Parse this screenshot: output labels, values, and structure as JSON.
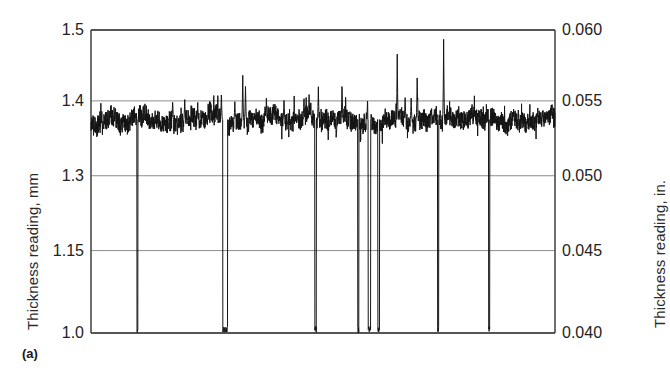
{
  "figure": {
    "caption": "(a)",
    "background_color": "#ffffff",
    "trace_color": "#141414",
    "grid_color": "#808080",
    "frame_color": "#4a4a4a"
  },
  "axes": {
    "left_title": "Thickness reading, mm",
    "right_title": "Thickness reading, in.",
    "left_ticks": [
      "1.5",
      "1.4",
      "1.3",
      "1.15",
      "1.0"
    ],
    "right_ticks": [
      "0.060",
      "0.055",
      "0.050",
      "0.045",
      "0.040"
    ]
  },
  "chart_data": {
    "type": "line",
    "title": "",
    "subtitle": "",
    "xlabel": "",
    "ylabel": "Thickness reading, mm",
    "ylabel_secondary": "Thickness reading, in.",
    "grid": true,
    "legend": "none",
    "annotations": [
      "(a)"
    ],
    "ylim": [
      1.0,
      1.5
    ],
    "ylim_secondary": [
      0.04,
      0.06
    ],
    "ytick_labels": [
      "1.5",
      "1.4",
      "1.3",
      "1.15",
      "1.0"
    ],
    "ytick_values": [
      1.5,
      1.4,
      1.3,
      1.15,
      1.0
    ],
    "ytick_positions_fraction": [
      0.0,
      0.234,
      0.481,
      0.728,
      1.0
    ],
    "ytick_labels_secondary": [
      "0.060",
      "0.055",
      "0.050",
      "0.045",
      "0.040"
    ],
    "ytick_values_secondary": [
      0.06,
      0.055,
      0.05,
      0.045,
      0.04
    ],
    "xlim": [
      0,
      1000
    ],
    "xtick_labels": [],
    "series": [
      {
        "name": "Thickness reading",
        "description": "Continuous thickness trace: noisy baseline near 1.375 mm with narrow upward spikes and several full-depth dropouts to 1.0 mm",
        "baseline_mm": 1.375,
        "noise_amplitude_mm": 0.022,
        "up_spikes": [
          {
            "x": 100,
            "peak_mm": 1.492
          },
          {
            "x": 176,
            "peak_mm": 1.402
          },
          {
            "x": 202,
            "peak_mm": 1.404
          },
          {
            "x": 230,
            "peak_mm": 1.398
          },
          {
            "x": 281,
            "peak_mm": 1.414
          },
          {
            "x": 310,
            "peak_mm": 1.399
          },
          {
            "x": 327,
            "peak_mm": 1.441
          },
          {
            "x": 333,
            "peak_mm": 1.424
          },
          {
            "x": 378,
            "peak_mm": 1.406
          },
          {
            "x": 416,
            "peak_mm": 1.405
          },
          {
            "x": 459,
            "peak_mm": 1.408
          },
          {
            "x": 470,
            "peak_mm": 1.409
          },
          {
            "x": 484,
            "peak_mm": 1.407
          },
          {
            "x": 490,
            "peak_mm": 1.42
          },
          {
            "x": 541,
            "peak_mm": 1.428
          },
          {
            "x": 596,
            "peak_mm": 1.404
          },
          {
            "x": 660,
            "peak_mm": 1.466
          },
          {
            "x": 677,
            "peak_mm": 1.407
          },
          {
            "x": 690,
            "peak_mm": 1.404
          },
          {
            "x": 703,
            "peak_mm": 1.437
          },
          {
            "x": 760,
            "peak_mm": 1.487
          }
        ],
        "down_spikes": [
          {
            "x": 100,
            "min_mm": 1.0,
            "width": 4
          },
          {
            "x": 289,
            "min_mm": 1.0,
            "width": 12
          },
          {
            "x": 484,
            "min_mm": 1.0,
            "width": 5
          },
          {
            "x": 576,
            "min_mm": 1.0,
            "width": 4
          },
          {
            "x": 600,
            "min_mm": 1.0,
            "width": 7
          },
          {
            "x": 620,
            "min_mm": 1.0,
            "width": 5
          },
          {
            "x": 748,
            "min_mm": 1.0,
            "width": 4
          },
          {
            "x": 858,
            "min_mm": 1.0,
            "width": 4
          }
        ]
      }
    ]
  }
}
